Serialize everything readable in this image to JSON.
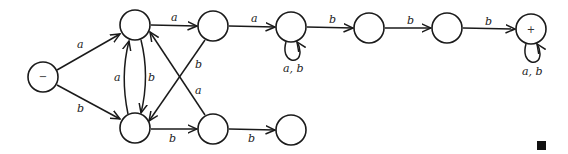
{
  "diagram": {
    "type": "finite-automaton",
    "nodes": [
      {
        "id": "start",
        "label": "−",
        "cx": 43,
        "cy": 77
      },
      {
        "id": "t1",
        "label": "",
        "cx": 135,
        "cy": 25
      },
      {
        "id": "b1",
        "label": "",
        "cx": 135,
        "cy": 128
      },
      {
        "id": "t2",
        "label": "",
        "cx": 213,
        "cy": 26
      },
      {
        "id": "b2",
        "label": "",
        "cx": 213,
        "cy": 129
      },
      {
        "id": "t3",
        "label": "",
        "cx": 291,
        "cy": 27
      },
      {
        "id": "b3",
        "label": "",
        "cx": 291,
        "cy": 130
      },
      {
        "id": "t4",
        "label": "",
        "cx": 369,
        "cy": 28
      },
      {
        "id": "t5",
        "label": "",
        "cx": 447,
        "cy": 28
      },
      {
        "id": "final",
        "label": "+",
        "cx": 531,
        "cy": 29
      }
    ],
    "edges": [
      {
        "from": "start",
        "to": "t1",
        "label": "a"
      },
      {
        "from": "start",
        "to": "b1",
        "label": "b"
      },
      {
        "from": "b1",
        "to": "t1",
        "label": "a"
      },
      {
        "from": "t1",
        "to": "b1",
        "label": "b"
      },
      {
        "from": "t1",
        "to": "t2",
        "label": "a"
      },
      {
        "from": "t2",
        "to": "b1",
        "label": "b"
      },
      {
        "from": "b2",
        "to": "t1",
        "label": "a"
      },
      {
        "from": "b1",
        "to": "b2",
        "label": "b"
      },
      {
        "from": "b2",
        "to": "b3",
        "label": "b"
      },
      {
        "from": "t2",
        "to": "t3",
        "label": "a"
      },
      {
        "from": "t3",
        "to": "t3",
        "label": "a, b"
      },
      {
        "from": "t3",
        "to": "t4",
        "label": "b"
      },
      {
        "from": "t4",
        "to": "t5",
        "label": "b"
      },
      {
        "from": "t5",
        "to": "final",
        "label": "b"
      },
      {
        "from": "final",
        "to": "final",
        "label": "a, b"
      }
    ],
    "end_mark": "■"
  }
}
